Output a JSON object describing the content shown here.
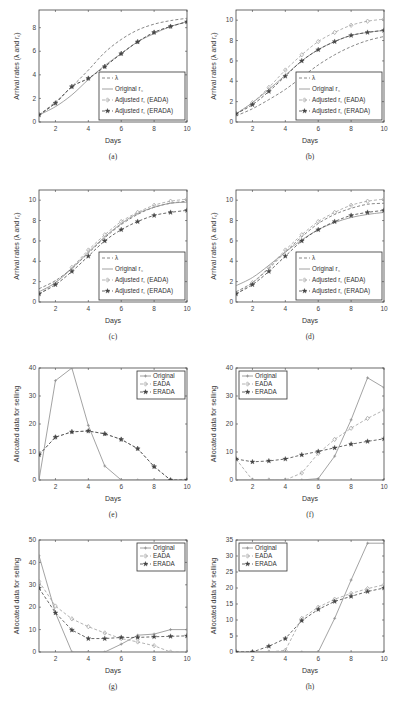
{
  "chart_data": [
    {
      "id": "a",
      "type": "line",
      "caption": "(a)",
      "xlabel": "Days",
      "ylabel": "Arrival rates (λ and r_c)",
      "xlim": [
        1,
        10
      ],
      "ylim": [
        0,
        9.5
      ],
      "xticks": [
        2,
        4,
        6,
        8,
        10
      ],
      "yticks": [
        0,
        2,
        4,
        6,
        8
      ],
      "legend": {
        "position": "lower right",
        "entries": [
          "λ",
          "Original r_c",
          "Adjusted r_c (EADA)",
          "Adjusted r_c (ERADA)"
        ]
      },
      "x": [
        1,
        2,
        3,
        4,
        5,
        6,
        7,
        8,
        9,
        10
      ],
      "series": [
        {
          "name": "λ",
          "style": "dashed",
          "values": [
            0.6,
            1.7,
            3.0,
            4.4,
            5.9,
            7.0,
            7.8,
            8.3,
            8.6,
            8.8
          ]
        },
        {
          "name": "Original r_c",
          "style": "solid",
          "values": [
            0.6,
            1.3,
            2.3,
            3.6,
            4.8,
            5.8,
            6.8,
            7.5,
            8.1,
            8.5
          ]
        },
        {
          "name": "Adjusted r_c (EADA)",
          "style": "dashed-diamond",
          "values": [
            0.6,
            1.6,
            3.0,
            3.7,
            4.7,
            5.8,
            6.8,
            7.6,
            8.1,
            8.5
          ]
        },
        {
          "name": "Adjusted r_c (ERADA)",
          "style": "dashed-star",
          "values": [
            0.6,
            1.6,
            3.0,
            3.7,
            4.7,
            5.8,
            6.8,
            7.6,
            8.1,
            8.5
          ]
        }
      ]
    },
    {
      "id": "b",
      "type": "line",
      "caption": "(b)",
      "xlabel": "Days",
      "ylabel": "Arrival rates (λ and r_c)",
      "xlim": [
        1,
        10
      ],
      "ylim": [
        0,
        11
      ],
      "xticks": [
        2,
        4,
        6,
        8,
        10
      ],
      "yticks": [
        0,
        2,
        4,
        6,
        8,
        10
      ],
      "legend": {
        "position": "lower right",
        "entries": [
          "λ",
          "Original r_c",
          "Adjusted r_c (EADA)",
          "Adjusted r_c (ERADA)"
        ]
      },
      "x": [
        1,
        2,
        3,
        4,
        5,
        6,
        7,
        8,
        9,
        10
      ],
      "series": [
        {
          "name": "λ",
          "style": "dashed",
          "values": [
            0.6,
            1.3,
            2.2,
            3.2,
            4.4,
            5.6,
            6.6,
            7.4,
            8.0,
            8.4
          ]
        },
        {
          "name": "Original r_c",
          "style": "solid",
          "values": [
            0.8,
            1.9,
            3.2,
            4.6,
            6.0,
            7.1,
            7.9,
            8.5,
            8.8,
            9.0
          ]
        },
        {
          "name": "Adjusted r_c (EADA)",
          "style": "dashed-diamond",
          "values": [
            0.8,
            1.9,
            3.4,
            5.1,
            6.6,
            7.9,
            8.8,
            9.5,
            9.9,
            10.1
          ]
        },
        {
          "name": "Adjusted r_c (ERADA)",
          "style": "dashed-star",
          "values": [
            0.8,
            1.7,
            3.0,
            4.5,
            6.0,
            7.1,
            7.9,
            8.5,
            8.8,
            9.0
          ]
        }
      ]
    },
    {
      "id": "c",
      "type": "line",
      "caption": "(c)",
      "xlabel": "Days",
      "ylabel": "Arrival rates (λ and r_c)",
      "xlim": [
        1,
        10
      ],
      "ylim": [
        0,
        11
      ],
      "xticks": [
        2,
        4,
        6,
        8,
        10
      ],
      "yticks": [
        0,
        2,
        4,
        6,
        8,
        10
      ],
      "legend": {
        "position": "lower right",
        "entries": [
          "λ",
          "Original r_c",
          "Adjusted r_c (EADA)",
          "Adjusted r_c (ERADA)"
        ]
      },
      "x": [
        1,
        2,
        3,
        4,
        5,
        6,
        7,
        8,
        9,
        10
      ],
      "series": [
        {
          "name": "λ",
          "style": "dashed",
          "values": [
            1.3,
            2.1,
            3.3,
            4.8,
            6.3,
            7.6,
            8.6,
            9.3,
            9.7,
            9.9
          ]
        },
        {
          "name": "Original r_c",
          "style": "solid",
          "values": [
            1.0,
            1.9,
            3.3,
            4.9,
            6.4,
            7.7,
            8.7,
            9.3,
            9.7,
            9.8
          ]
        },
        {
          "name": "Adjusted r_c (EADA)",
          "style": "dashed-diamond",
          "values": [
            0.8,
            1.9,
            3.4,
            5.1,
            6.6,
            7.9,
            8.8,
            9.5,
            9.9,
            10.1
          ]
        },
        {
          "name": "Adjusted r_c (ERADA)",
          "style": "dashed-star",
          "values": [
            0.8,
            1.7,
            3.0,
            4.5,
            6.0,
            7.1,
            7.9,
            8.5,
            8.8,
            9.0
          ]
        }
      ]
    },
    {
      "id": "d",
      "type": "line",
      "caption": "(d)",
      "xlabel": "Days",
      "ylabel": "Arrival rates (λ and r_c)",
      "xlim": [
        1,
        10
      ],
      "ylim": [
        0,
        11
      ],
      "xticks": [
        2,
        4,
        6,
        8,
        10
      ],
      "yticks": [
        0,
        2,
        4,
        6,
        8,
        10
      ],
      "legend": {
        "position": "lower right",
        "entries": [
          "λ",
          "Original r_c",
          "Adjusted r_c (EADA)",
          "Adjusted r_c (ERADA)"
        ]
      },
      "x": [
        1,
        2,
        3,
        4,
        5,
        6,
        7,
        8,
        9,
        10
      ],
      "series": [
        {
          "name": "λ",
          "style": "dashed",
          "values": [
            1.0,
            1.9,
            3.3,
            4.9,
            6.4,
            7.7,
            8.6,
            9.2,
            9.6,
            9.7
          ]
        },
        {
          "name": "Original r_c",
          "style": "solid",
          "values": [
            1.6,
            2.4,
            3.6,
            4.9,
            6.1,
            7.1,
            7.8,
            8.3,
            8.6,
            8.8
          ]
        },
        {
          "name": "Adjusted r_c (EADA)",
          "style": "dashed-diamond",
          "values": [
            0.8,
            1.9,
            3.4,
            5.1,
            6.6,
            7.9,
            8.8,
            9.5,
            9.9,
            10.1
          ]
        },
        {
          "name": "Adjusted r_c (ERADA)",
          "style": "dashed-star",
          "values": [
            0.8,
            1.7,
            3.0,
            4.5,
            6.0,
            7.1,
            7.9,
            8.5,
            8.8,
            9.0
          ]
        }
      ]
    },
    {
      "id": "e",
      "type": "line",
      "caption": "(e)",
      "xlabel": "Days",
      "ylabel": "Allocated data for selling",
      "xlim": [
        1,
        10
      ],
      "ylim": [
        0,
        40
      ],
      "xticks": [
        2,
        4,
        6,
        8,
        10
      ],
      "yticks": [
        0,
        10,
        20,
        30,
        40
      ],
      "legend": {
        "position": "upper right",
        "entries": [
          "Original",
          "EADA",
          "ERADA"
        ]
      },
      "x": [
        1,
        2,
        3,
        4,
        5,
        6,
        7,
        8,
        9,
        10
      ],
      "series": [
        {
          "name": "Original",
          "style": "solid",
          "values": [
            0,
            35.5,
            40,
            19.5,
            5,
            0,
            0,
            0,
            0,
            0
          ]
        },
        {
          "name": "EADA",
          "style": "dashed-diamond",
          "values": [
            9,
            15.3,
            17.2,
            17.5,
            16.5,
            14.5,
            11.2,
            4.8,
            0,
            0
          ]
        },
        {
          "name": "ERADA",
          "style": "dashed-star",
          "values": [
            9,
            15.3,
            17.2,
            17.5,
            16.5,
            14.5,
            11.2,
            4.8,
            0,
            0
          ]
        }
      ]
    },
    {
      "id": "f",
      "type": "line",
      "caption": "(f)",
      "xlabel": "Days",
      "ylabel": "Allocated data for selling",
      "xlim": [
        1,
        10
      ],
      "ylim": [
        0,
        40
      ],
      "xticks": [
        2,
        4,
        6,
        8,
        10
      ],
      "yticks": [
        0,
        10,
        20,
        30,
        40
      ],
      "legend": {
        "position": "upper left",
        "entries": [
          "Original",
          "EADA",
          "ERADA"
        ]
      },
      "x": [
        1,
        2,
        3,
        4,
        5,
        6,
        7,
        8,
        9,
        10
      ],
      "series": [
        {
          "name": "Original",
          "style": "solid",
          "values": [
            0,
            0,
            0,
            0,
            0,
            0.5,
            8.5,
            21.5,
            36.5,
            33
          ]
        },
        {
          "name": "EADA",
          "style": "dashed-diamond",
          "values": [
            7.5,
            0,
            0,
            0,
            2.5,
            9.5,
            14.5,
            18.5,
            22,
            25
          ]
        },
        {
          "name": "ERADA",
          "style": "dashed-star",
          "values": [
            7.5,
            6.5,
            6.8,
            7.5,
            9,
            10.2,
            11.5,
            12.8,
            13.8,
            14.7
          ]
        }
      ]
    },
    {
      "id": "g",
      "type": "line",
      "caption": "(g)",
      "xlabel": "Days",
      "ylabel": "Allocated data for selling",
      "xlim": [
        1,
        10
      ],
      "ylim": [
        0,
        50
      ],
      "xticks": [
        2,
        4,
        6,
        8,
        10
      ],
      "yticks": [
        0,
        10,
        20,
        30,
        40,
        50
      ],
      "legend": {
        "position": "upper right",
        "entries": [
          "Original",
          "EADA",
          "ERADA"
        ]
      },
      "x": [
        1,
        2,
        3,
        4,
        5,
        6,
        7,
        8,
        9,
        10
      ],
      "series": [
        {
          "name": "Original",
          "style": "solid",
          "values": [
            43,
            17.5,
            0,
            0,
            0,
            3.5,
            7.5,
            8,
            10,
            10
          ]
        },
        {
          "name": "EADA",
          "style": "dashed-diamond",
          "values": [
            31.5,
            20.5,
            14.8,
            11.3,
            8.5,
            6,
            4.5,
            2.8,
            0,
            0
          ]
        },
        {
          "name": "ERADA",
          "style": "dashed-star",
          "values": [
            28.5,
            17.5,
            9.8,
            6,
            6,
            6.5,
            6.5,
            6.8,
            7,
            7.2
          ]
        }
      ]
    },
    {
      "id": "h",
      "type": "line",
      "caption": "(h)",
      "xlabel": "Days",
      "ylabel": "Allocated data for selling",
      "xlim": [
        1,
        10
      ],
      "ylim": [
        0,
        35
      ],
      "xticks": [
        2,
        4,
        6,
        8,
        10
      ],
      "yticks": [
        0,
        5,
        10,
        15,
        20,
        25,
        30,
        35
      ],
      "legend": {
        "position": "upper left",
        "entries": [
          "Original",
          "EADA",
          "ERADA"
        ]
      },
      "x": [
        1,
        2,
        3,
        4,
        5,
        6,
        7,
        8,
        9,
        10
      ],
      "series": [
        {
          "name": "Original",
          "style": "solid",
          "values": [
            0,
            0,
            0,
            0,
            0,
            0,
            10.5,
            22.5,
            34,
            34
          ]
        },
        {
          "name": "EADA",
          "style": "dashed-diamond",
          "values": [
            0,
            0,
            0,
            0.5,
            10.5,
            14,
            16.5,
            18.3,
            19.8,
            21
          ]
        },
        {
          "name": "ERADA",
          "style": "dashed-star",
          "values": [
            0,
            0,
            1.8,
            4.2,
            9.8,
            13.3,
            15.8,
            17.4,
            18.9,
            20
          ]
        }
      ]
    }
  ],
  "colors": {
    "axis": "#333333",
    "line_lambda": "#6f6f6f",
    "line_original": "#8a8a8a",
    "line_eada": "#9a9a9a",
    "line_erada": "#4a4a4a"
  }
}
